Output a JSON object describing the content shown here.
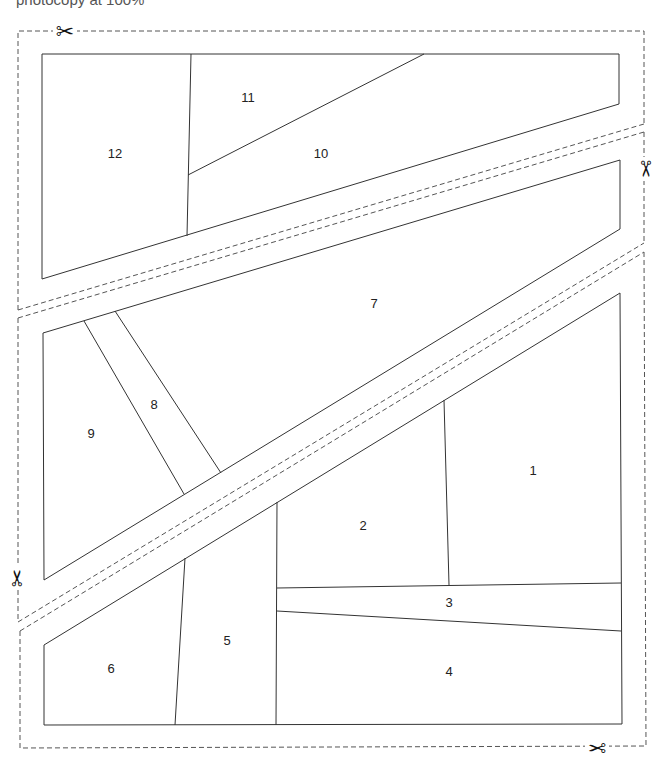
{
  "caption": "photocopy at 100%",
  "icons": {
    "scissors": "✂"
  },
  "pieces": [
    {
      "id": "1",
      "label": "1",
      "x": 533,
      "y": 472
    },
    {
      "id": "2",
      "label": "2",
      "x": 363,
      "y": 527
    },
    {
      "id": "3",
      "label": "3",
      "x": 449,
      "y": 604
    },
    {
      "id": "4",
      "label": "4",
      "x": 449,
      "y": 673
    },
    {
      "id": "5",
      "label": "5",
      "x": 227,
      "y": 642
    },
    {
      "id": "6",
      "label": "6",
      "x": 111,
      "y": 670
    },
    {
      "id": "7",
      "label": "7",
      "x": 374,
      "y": 305
    },
    {
      "id": "8",
      "label": "8",
      "x": 154,
      "y": 406
    },
    {
      "id": "9",
      "label": "9",
      "x": 91,
      "y": 435
    },
    {
      "id": "10",
      "label": "10",
      "x": 321,
      "y": 155
    },
    {
      "id": "11",
      "label": "11",
      "x": 248,
      "y": 99
    },
    {
      "id": "12",
      "label": "12",
      "x": 115,
      "y": 155
    }
  ]
}
